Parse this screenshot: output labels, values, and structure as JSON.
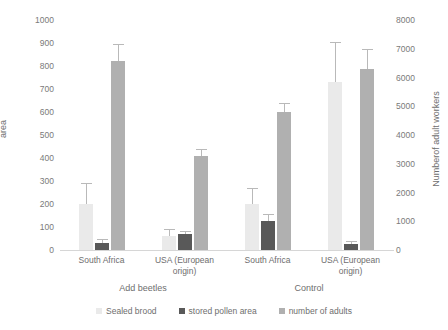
{
  "chart_data": {
    "type": "bar",
    "title": "",
    "categories": [
      "South Africa",
      "USA (European origin)",
      "South Africa",
      "USA (European origin)"
    ],
    "group_labels": [
      "Add beetles",
      "Control"
    ],
    "series": [
      {
        "name": "Sealed brood",
        "axis": "left",
        "color": "#eaeaea",
        "values": [
          200,
          60,
          200,
          730
        ],
        "errors": [
          85,
          25,
          65,
          170
        ]
      },
      {
        "name": "stored pollen area",
        "axis": "left",
        "color": "#595959",
        "values": [
          30,
          70,
          125,
          25
        ],
        "errors": [
          12,
          10,
          28,
          10
        ]
      },
      {
        "name": "number of adults",
        "axis": "right",
        "color": "#b0b0b0",
        "values": [
          6550,
          3280,
          4800,
          6280
        ],
        "values_left_scale": [
          820,
          410,
          600,
          785
        ],
        "errors": [
          560,
          200,
          280,
          680
        ]
      }
    ],
    "ylabel": "area",
    "ylabel_right": "Numberof adult workers",
    "xlabel": "",
    "ylim": [
      0,
      1000
    ],
    "ylim_right": [
      0,
      8000
    ],
    "yticks": [
      0,
      100,
      200,
      300,
      400,
      500,
      600,
      700,
      800,
      900,
      1000
    ],
    "yticks_right": [
      0,
      1000,
      2000,
      3000,
      4000,
      5000,
      6000,
      7000,
      8000
    ],
    "grid": false,
    "legend_position": "bottom"
  },
  "legend": {
    "items": [
      {
        "label": "Sealed brood",
        "color": "#eaeaea"
      },
      {
        "label": "stored pollen area",
        "color": "#595959"
      },
      {
        "label": "number of adults",
        "color": "#b0b0b0"
      }
    ]
  }
}
